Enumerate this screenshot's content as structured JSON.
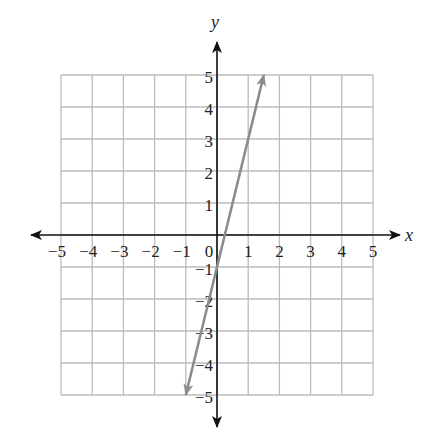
{
  "chart_data": {
    "type": "line",
    "title": "",
    "xlabel": "x",
    "ylabel": "y",
    "xlim": [
      -5,
      5
    ],
    "ylim": [
      -5,
      5
    ],
    "grid": true,
    "x_ticks": [
      "−5",
      "−4",
      "−3",
      "−2",
      "−1",
      "0",
      "1",
      "2",
      "3",
      "4",
      "5"
    ],
    "y_ticks": [
      "5",
      "4",
      "3",
      "2",
      "1",
      "−1",
      "−2",
      "−3",
      "−4",
      "−5"
    ],
    "series": [
      {
        "name": "line",
        "equation": "y = 4x − 1",
        "x": [
          -1,
          1.5
        ],
        "y": [
          -5,
          5
        ],
        "arrows_both_ends": true,
        "color": "#8c8c8c"
      }
    ],
    "legend": null
  },
  "colors": {
    "grid": "#bcbcbc",
    "axis": "#111111",
    "line": "#8c8c8c"
  }
}
